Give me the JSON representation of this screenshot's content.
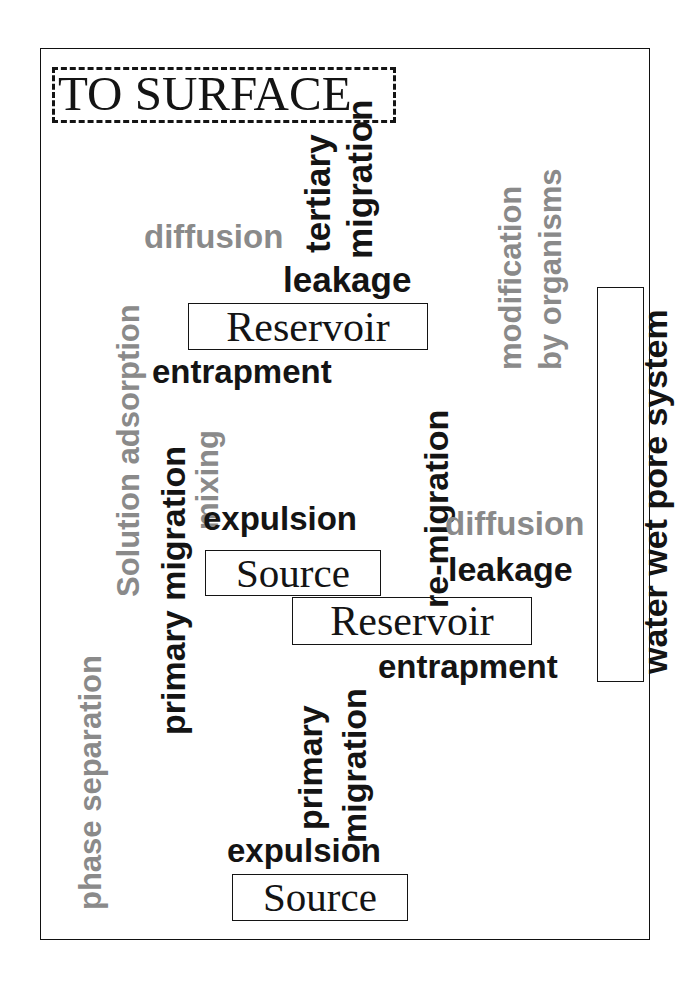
{
  "figure": {
    "type": "conceptual-diagram",
    "colors": {
      "primary_text": "#141414",
      "secondary_text": "#8a8a8a",
      "frame": "#111111",
      "background": "#ffffff"
    }
  },
  "frame": {
    "outer_border": "solid"
  },
  "labels": {
    "to_surface": "TO SURFACE",
    "diffusion_top": "diffusion",
    "tertiary": "tertiary",
    "migration_tertiary": "migration",
    "leakage_top": "leakage",
    "reservoir_top": "Reservoir",
    "entrapment_top": "entrapment",
    "modification": "modification",
    "by_organisms": "by organisms",
    "water_wet_pore_system": "water wet pore system",
    "solution_adsorption": "Solution adsorption",
    "mixing": "mixing",
    "primary_migration_upper": "primary migration",
    "re_migration": "re-migration",
    "expulsion_upper": "expulsion",
    "source_upper": "Source",
    "diffusion_lower": "diffusion",
    "leakage_lower": "leakage",
    "reservoir_lower": "Reservoir",
    "entrapment_lower": "entrapment",
    "phase_separation": "phase separation",
    "primary_lower": "primary",
    "migration_lower": "migration",
    "expulsion_lower": "expulsion",
    "source_lower": "Source"
  }
}
